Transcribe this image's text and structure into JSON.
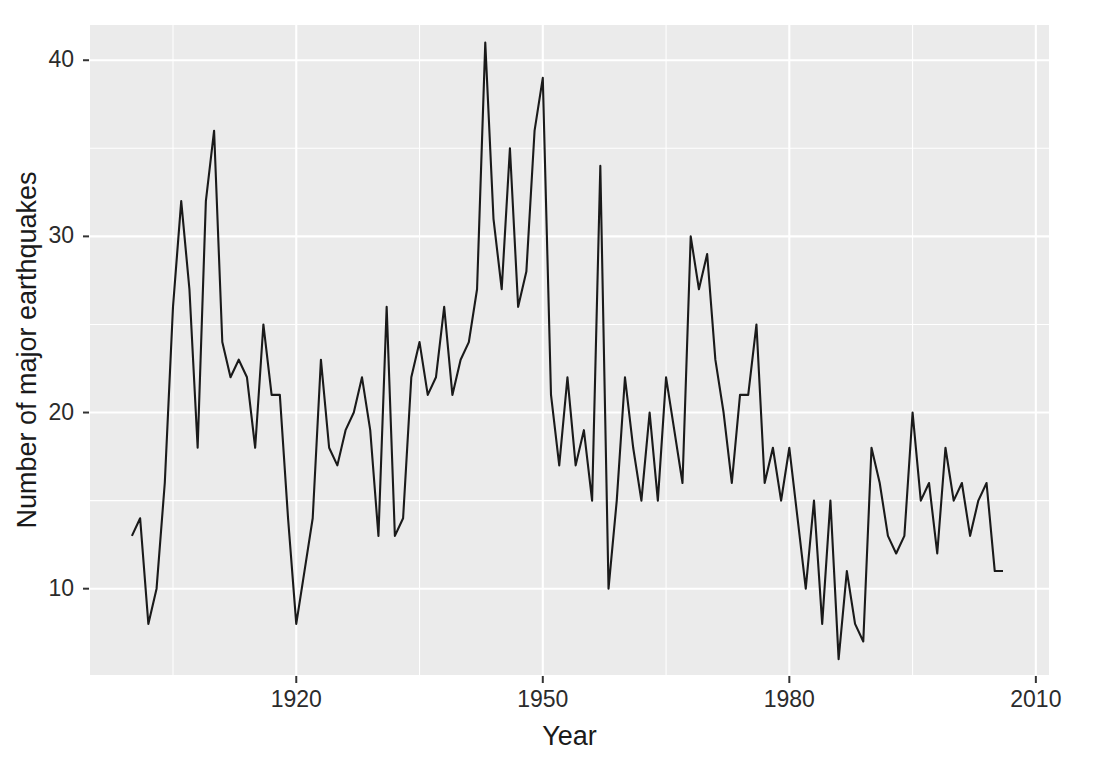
{
  "chart_data": {
    "type": "line",
    "title": "",
    "subtitle": "",
    "xlabel": "Year",
    "ylabel": "Number of major earthquakes",
    "xlim": [
      1894.9,
      2011.6
    ],
    "ylim": [
      5.1,
      42.0
    ],
    "grid": true,
    "legend": "none",
    "legend_position": "none",
    "series_color": "#1a1a1a",
    "panel_color": "#ebebeb",
    "gridline_color": "#ffffff",
    "x_ticks": [
      1920,
      1950,
      1980,
      2010
    ],
    "x_tick_labels": [
      "1920",
      "1950",
      "1980",
      "2010"
    ],
    "x_minor_ticks": [
      1905,
      1935,
      1965,
      1995
    ],
    "y_ticks": [
      10,
      20,
      30,
      40
    ],
    "y_tick_labels": [
      "10",
      "20",
      "30",
      "40"
    ],
    "y_minor_ticks": [
      15,
      25,
      35
    ],
    "x": [
      1900,
      1901,
      1902,
      1903,
      1904,
      1905,
      1906,
      1907,
      1908,
      1909,
      1910,
      1911,
      1912,
      1913,
      1914,
      1915,
      1916,
      1917,
      1918,
      1919,
      1920,
      1921,
      1922,
      1923,
      1924,
      1925,
      1926,
      1927,
      1928,
      1929,
      1930,
      1931,
      1932,
      1933,
      1934,
      1935,
      1936,
      1937,
      1938,
      1939,
      1940,
      1941,
      1942,
      1943,
      1944,
      1945,
      1946,
      1947,
      1948,
      1949,
      1950,
      1951,
      1952,
      1953,
      1954,
      1955,
      1956,
      1957,
      1958,
      1959,
      1960,
      1961,
      1962,
      1963,
      1964,
      1965,
      1966,
      1967,
      1968,
      1969,
      1970,
      1971,
      1972,
      1973,
      1974,
      1975,
      1976,
      1977,
      1978,
      1979,
      1980,
      1981,
      1982,
      1983,
      1984,
      1985,
      1986,
      1987,
      1988,
      1989,
      1990,
      1991,
      1992,
      1993,
      1994,
      1995,
      1996,
      1997,
      1998,
      1999,
      2000,
      2001,
      2002,
      2003,
      2004,
      2005,
      2006
    ],
    "values": [
      13,
      14,
      8,
      10,
      16,
      26,
      32,
      27,
      18,
      32,
      36,
      24,
      22,
      23,
      22,
      18,
      25,
      21,
      21,
      14,
      8,
      11,
      14,
      23,
      18,
      17,
      19,
      20,
      22,
      19,
      13,
      26,
      13,
      14,
      22,
      24,
      21,
      22,
      26,
      21,
      23,
      24,
      27,
      41,
      31,
      27,
      35,
      26,
      28,
      36,
      39,
      21,
      17,
      22,
      17,
      19,
      15,
      34,
      10,
      15,
      22,
      18,
      15,
      20,
      15,
      22,
      19,
      16,
      30,
      27,
      29,
      23,
      20,
      16,
      21,
      21,
      25,
      16,
      18,
      15,
      18,
      14,
      10,
      15,
      8,
      15,
      6,
      11,
      8,
      7,
      18,
      16,
      13,
      12,
      13,
      20,
      15,
      16,
      12,
      18,
      15,
      16,
      13,
      15,
      16,
      11,
      11
    ]
  }
}
